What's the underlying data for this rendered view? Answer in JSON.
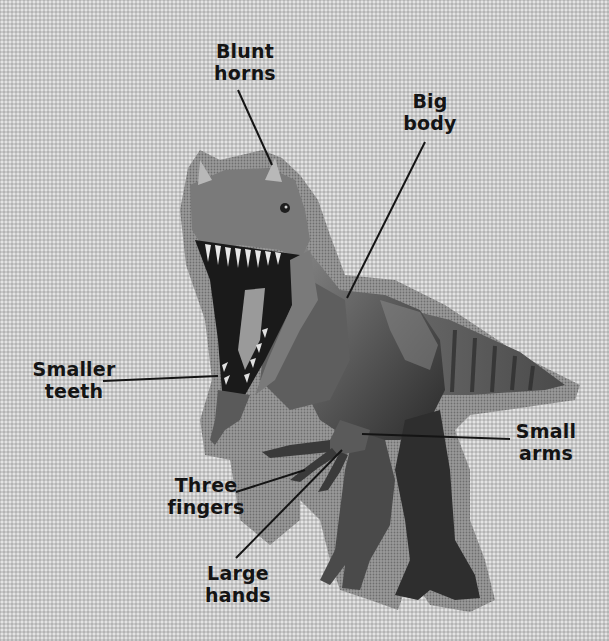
{
  "figure": {
    "colors": {
      "background": "#c9c9c9",
      "halo": "#8f8f8f",
      "body_dark": "#2e2e2e",
      "body_mid": "#6a6a6a",
      "body_light": "#a8a8a8",
      "label_text": "#141414",
      "leader_line": "#141414"
    }
  },
  "labels": {
    "blunt_horns": {
      "line1": "Blunt",
      "line2": "horns"
    },
    "big_body": {
      "line1": "Big",
      "line2": "body"
    },
    "smaller_teeth": {
      "line1": "Smaller",
      "line2": "teeth"
    },
    "small_arms": {
      "line1": "Small",
      "line2": "arms"
    },
    "three_fingers": {
      "line1": "Three",
      "line2": "fingers"
    },
    "large_hands": {
      "line1": "Large",
      "line2": "hands"
    }
  }
}
